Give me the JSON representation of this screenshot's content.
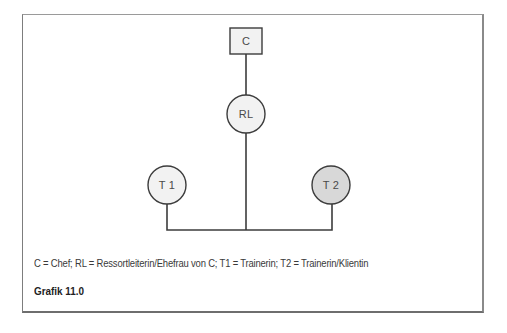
{
  "diagram": {
    "nodes": [
      {
        "id": "C",
        "label": "C",
        "shape": "square",
        "fill": "#f2f2f2"
      },
      {
        "id": "RL",
        "label": "RL",
        "shape": "circle",
        "fill": "#f2f2f2"
      },
      {
        "id": "T1",
        "label": "T 1",
        "shape": "circle",
        "fill": "#f2f2f2"
      },
      {
        "id": "T2",
        "label": "T 2",
        "shape": "circle",
        "fill": "#d8d8d8"
      }
    ],
    "edges": [
      {
        "from": "C",
        "to": "RL"
      },
      {
        "from": "RL",
        "to": "T1"
      },
      {
        "from": "RL",
        "to": "T2"
      }
    ],
    "stroke_color": "#3c3c3c"
  },
  "legend": {
    "text": "C = Chef; RL = Ressortleiterin/Ehefrau von C; T1 = Trainerin; T2 = Trainerin/Klientin"
  },
  "figure": {
    "title": "Grafik 11.0"
  }
}
